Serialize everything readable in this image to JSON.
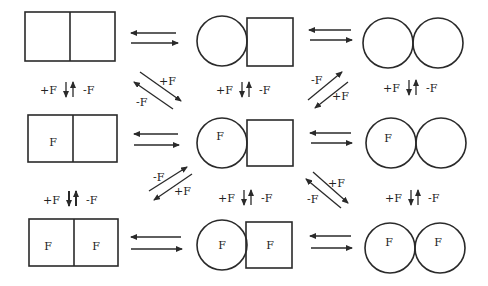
{
  "diagram": {
    "type": "reaction-scheme",
    "rows": [
      {
        "states": [
          {
            "shape": "two-squares",
            "labels": [
              "",
              ""
            ]
          },
          {
            "shape": "circle-square",
            "labels": [
              "",
              ""
            ]
          },
          {
            "shape": "two-circles",
            "labels": [
              "",
              ""
            ]
          }
        ]
      },
      {
        "states": [
          {
            "shape": "two-squares",
            "labels": [
              "F",
              ""
            ]
          },
          {
            "shape": "circle-square",
            "labels": [
              "F",
              ""
            ]
          },
          {
            "shape": "two-circles",
            "labels": [
              "F",
              ""
            ]
          }
        ]
      },
      {
        "states": [
          {
            "shape": "two-squares",
            "labels": [
              "F",
              "F"
            ]
          },
          {
            "shape": "circle-square",
            "labels": [
              "F",
              "F"
            ]
          },
          {
            "shape": "two-circles",
            "labels": [
              "F",
              "F"
            ]
          }
        ]
      }
    ],
    "vertical_labels": {
      "plus": "+F",
      "minus": "-F",
      "arrows": "↓↑"
    },
    "diagonal_labels": {
      "top_left": {
        "upper": "+F",
        "lower": "-F"
      },
      "top_right": {
        "upper": "-F",
        "lower": "+F"
      },
      "bottom_left": {
        "upper": "-F",
        "lower": "+F"
      },
      "bottom_right": {
        "upper": "+F",
        "lower": "-F"
      }
    }
  }
}
